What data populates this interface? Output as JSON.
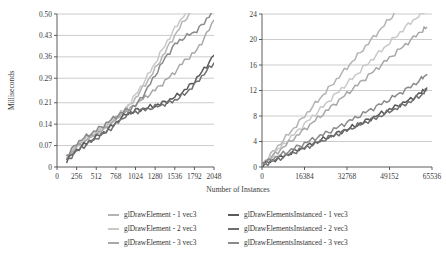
{
  "figure": {
    "xlabel": "Number of Instances",
    "ylabel": "Milliseconds"
  },
  "series_colors": {
    "glDrawElement_1": "#b4b4b4",
    "glDrawElement_2": "#c9c9c9",
    "glDrawElement_3": "#a8a8a8",
    "glDrawElementsInstanced_1": "#5a5a5a",
    "glDrawElementsInstanced_2": "#6f6f6f",
    "glDrawElementsInstanced_3": "#8a8a8a"
  },
  "legend": {
    "columns": [
      {
        "items": [
          {
            "label": "glDrawElement - 1 vec3",
            "color": "#b4b4b4",
            "icon": "line-swatch-icon"
          },
          {
            "label": "glDrawElement - 2 vec3",
            "color": "#c9c9c9",
            "icon": "line-swatch-icon"
          },
          {
            "label": "glDrawElement - 3 vec3",
            "color": "#a8a8a8",
            "icon": "line-swatch-icon"
          }
        ]
      },
      {
        "items": [
          {
            "label": "glDrawElementsInstanced - 1 vec3",
            "color": "#5a5a5a",
            "icon": "line-swatch-icon"
          },
          {
            "label": "glDrawElementsInstanced - 2 vec3",
            "color": "#6f6f6f",
            "icon": "line-swatch-icon"
          },
          {
            "label": "glDrawElementsInstanced - 3 vec3",
            "color": "#8a8a8a",
            "icon": "line-swatch-icon"
          }
        ]
      }
    ]
  },
  "chart_data": [
    {
      "id": "left",
      "type": "line",
      "title": "",
      "xlabel": "Number of Instances",
      "ylabel": "Milliseconds",
      "grid": true,
      "legend_position": "bottom",
      "xlim": [
        0,
        2048
      ],
      "ylim": [
        0,
        0.5
      ],
      "xticks": [
        0,
        256,
        512,
        768,
        1024,
        1280,
        1536,
        1792,
        2048
      ],
      "xtick_labels": [
        "0",
        "256",
        "512",
        "768",
        "1024",
        "1280",
        "1536",
        "1792",
        "2048"
      ],
      "yticks": [
        0,
        0.07,
        0.14,
        0.21,
        0.29,
        0.36,
        0.43,
        0.5
      ],
      "ytick_labels": [
        "0",
        "0.07",
        "0.14",
        "0.21",
        "0.29",
        "0.36",
        "0.43",
        "0.50"
      ],
      "x": [
        128,
        256,
        384,
        512,
        640,
        768,
        896,
        1024,
        1152,
        1280,
        1408,
        1536,
        1664,
        1792,
        1920,
        2048
      ],
      "series": [
        {
          "name": "glDrawElement - 1 vec3",
          "color": "#b4b4b4",
          "values": [
            0.03,
            0.068,
            0.09,
            0.11,
            0.132,
            0.158,
            0.185,
            0.225,
            0.27,
            0.32,
            0.375,
            0.43,
            0.48,
            0.52,
            0.56,
            0.6
          ]
        },
        {
          "name": "glDrawElement - 2 vec3",
          "color": "#c9c9c9",
          "values": [
            0.032,
            0.072,
            0.094,
            0.114,
            0.136,
            0.162,
            0.192,
            0.235,
            0.285,
            0.34,
            0.398,
            0.452,
            0.5,
            0.545,
            0.585,
            0.625
          ]
        },
        {
          "name": "glDrawElement - 3 vec3",
          "color": "#a8a8a8",
          "values": [
            0.028,
            0.066,
            0.088,
            0.108,
            0.128,
            0.155,
            0.178,
            0.205,
            0.228,
            0.252,
            0.28,
            0.31,
            0.348,
            0.372,
            0.42,
            0.48
          ]
        },
        {
          "name": "glDrawElementsInstanced - 1 vec3",
          "color": "#5a5a5a",
          "values": [
            0.022,
            0.055,
            0.078,
            0.098,
            0.118,
            0.145,
            0.172,
            0.185,
            0.192,
            0.2,
            0.212,
            0.228,
            0.25,
            0.28,
            0.32,
            0.365
          ]
        },
        {
          "name": "glDrawElementsInstanced - 2 vec3",
          "color": "#6f6f6f",
          "values": [
            0.02,
            0.052,
            0.074,
            0.094,
            0.114,
            0.14,
            0.168,
            0.18,
            0.188,
            0.196,
            0.206,
            0.218,
            0.238,
            0.268,
            0.305,
            0.34
          ]
        },
        {
          "name": "glDrawElementsInstanced - 3 vec3",
          "color": "#8a8a8a",
          "values": [
            0.035,
            0.078,
            0.1,
            0.12,
            0.142,
            0.165,
            0.185,
            0.2,
            0.245,
            0.3,
            0.355,
            0.4,
            0.425,
            0.44,
            0.47,
            0.52
          ]
        }
      ]
    },
    {
      "id": "right",
      "type": "line",
      "title": "",
      "xlabel": "Number of Instances",
      "ylabel": "Milliseconds",
      "grid": true,
      "legend_position": "bottom",
      "xlim": [
        0,
        65536
      ],
      "ylim": [
        0,
        24
      ],
      "xticks": [
        0,
        16384,
        32768,
        49152,
        65536
      ],
      "xtick_labels": [
        "0",
        "16384",
        "32768",
        "49152",
        "65536"
      ],
      "yticks": [
        0,
        4,
        8,
        12,
        16,
        20,
        24
      ],
      "ytick_labels": [
        "0",
        "4",
        "8",
        "12",
        "16",
        "20",
        "24"
      ],
      "x": [
        512,
        4096,
        8192,
        12288,
        16384,
        20480,
        24576,
        28672,
        32768,
        36864,
        40960,
        45056,
        49152,
        53248,
        57344,
        61440,
        63488
      ],
      "series": [
        {
          "name": "glDrawElement - 1 vec3",
          "color": "#b4b4b4",
          "values": [
            0.6,
            2.3,
            4.2,
            6.1,
            8.0,
            9.9,
            11.8,
            13.7,
            15.6,
            17.5,
            19.4,
            21.3,
            23.2,
            25.1,
            27.0,
            28.8,
            29.7
          ]
        },
        {
          "name": "glDrawElement - 2 vec3",
          "color": "#c9c9c9",
          "values": [
            0.5,
            1.9,
            3.5,
            5.1,
            6.7,
            8.3,
            9.9,
            11.5,
            13.1,
            14.7,
            16.3,
            17.9,
            19.5,
            21.1,
            22.7,
            24.0,
            24.6
          ]
        },
        {
          "name": "glDrawElement - 3 vec3",
          "color": "#a8a8a8",
          "values": [
            0.5,
            1.7,
            3.1,
            4.5,
            5.9,
            7.3,
            8.7,
            10.1,
            11.5,
            12.9,
            14.3,
            15.7,
            17.1,
            18.5,
            19.9,
            21.3,
            21.9
          ]
        },
        {
          "name": "glDrawElementsInstanced - 1 vec3",
          "color": "#5a5a5a",
          "values": [
            0.4,
            1.0,
            1.7,
            2.4,
            3.1,
            3.8,
            4.5,
            5.2,
            5.9,
            6.6,
            7.4,
            8.2,
            9.0,
            9.8,
            10.6,
            11.7,
            12.4
          ]
        },
        {
          "name": "glDrawElementsInstanced - 2 vec3",
          "color": "#6f6f6f",
          "values": [
            0.4,
            0.9,
            1.6,
            2.3,
            3.0,
            3.7,
            4.4,
            5.1,
            5.8,
            6.5,
            7.2,
            7.9,
            8.7,
            9.5,
            10.3,
            11.3,
            12.1
          ]
        },
        {
          "name": "glDrawElementsInstanced - 3 vec3",
          "color": "#8a8a8a",
          "values": [
            0.5,
            1.3,
            2.1,
            2.9,
            3.7,
            4.5,
            5.3,
            6.1,
            7.0,
            7.9,
            8.8,
            9.7,
            10.6,
            11.6,
            12.6,
            13.8,
            14.5
          ]
        }
      ]
    }
  ]
}
